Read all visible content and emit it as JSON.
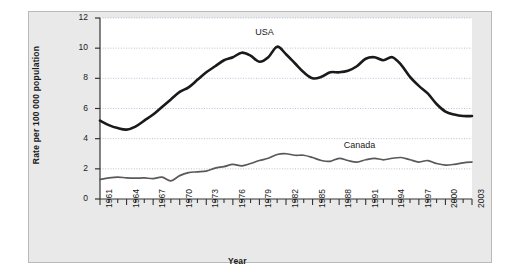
{
  "chart_data": {
    "type": "line",
    "title": "",
    "xlabel": "Year",
    "ylabel": "Rate per 100 000 population",
    "xlim": [
      1961,
      2003
    ],
    "ylim": [
      0,
      12
    ],
    "y_ticks": [
      0,
      2,
      4,
      6,
      8,
      10,
      12
    ],
    "x_tick_labels": [
      "1961",
      "1964",
      "1967",
      "1970",
      "1973",
      "1976",
      "1979",
      "1982",
      "1985",
      "1988",
      "1991",
      "1994",
      "1997",
      "2000",
      "2003"
    ],
    "x_tick_step_minor": 1,
    "x_tick_step_major": 3,
    "grid": "horizontal-dotted",
    "legend": "inline-annotations",
    "x": [
      1961,
      1962,
      1963,
      1964,
      1965,
      1966,
      1967,
      1968,
      1969,
      1970,
      1971,
      1972,
      1973,
      1974,
      1975,
      1976,
      1977,
      1978,
      1979,
      1980,
      1981,
      1982,
      1983,
      1984,
      1985,
      1986,
      1987,
      1988,
      1989,
      1990,
      1991,
      1992,
      1993,
      1994,
      1995,
      1996,
      1997,
      1998,
      1999,
      2000,
      2001,
      2002,
      2003
    ],
    "series": [
      {
        "name": "USA",
        "color": "#1a1a1a",
        "width": 2.6,
        "label_x": 1980,
        "label_y": 11.0,
        "values": [
          5.2,
          4.9,
          4.7,
          4.6,
          4.8,
          5.2,
          5.6,
          6.1,
          6.6,
          7.1,
          7.4,
          7.9,
          8.4,
          8.8,
          9.2,
          9.4,
          9.7,
          9.5,
          9.1,
          9.4,
          10.1,
          9.6,
          9.0,
          8.4,
          8.0,
          8.1,
          8.4,
          8.4,
          8.5,
          8.8,
          9.3,
          9.4,
          9.2,
          9.4,
          8.9,
          8.1,
          7.5,
          7.0,
          6.3,
          5.8,
          5.6,
          5.5,
          5.5
        ]
      },
      {
        "name": "Canada",
        "color": "#595959",
        "width": 1.7,
        "label_x": 1990,
        "label_y": 3.5,
        "values": [
          1.3,
          1.4,
          1.45,
          1.4,
          1.38,
          1.4,
          1.35,
          1.45,
          1.2,
          1.55,
          1.75,
          1.8,
          1.85,
          2.05,
          2.15,
          2.3,
          2.2,
          2.35,
          2.55,
          2.7,
          2.95,
          3.0,
          2.9,
          2.9,
          2.75,
          2.55,
          2.5,
          2.7,
          2.55,
          2.45,
          2.6,
          2.7,
          2.6,
          2.7,
          2.75,
          2.6,
          2.45,
          2.55,
          2.35,
          2.25,
          2.3,
          2.4,
          2.45
        ]
      }
    ]
  },
  "panel": {
    "background": "#e9e9e9",
    "plot_background": "#ffffff",
    "border_color": "#b9b9b9"
  }
}
